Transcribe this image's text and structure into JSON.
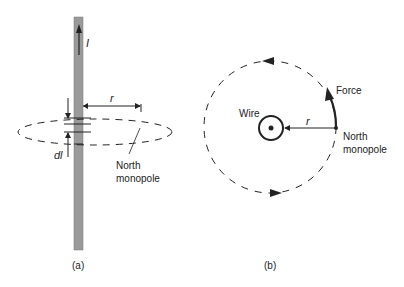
{
  "panel_a": {
    "caption": "(a)",
    "current_label": "I",
    "radius_label": "r",
    "segment_label": "dl",
    "monopole_label_line1": "North",
    "monopole_label_line2": "monopole"
  },
  "panel_b": {
    "caption": "(b)",
    "wire_label": "Wire",
    "radius_label": "r",
    "force_label": "Force",
    "monopole_label_line1": "North",
    "monopole_label_line2": "monopole"
  },
  "colors": {
    "wire_fill": "#9a9a9a",
    "line": "#222222",
    "background": "#ffffff"
  }
}
